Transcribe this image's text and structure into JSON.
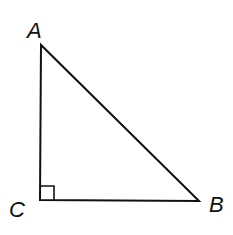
{
  "diagram": {
    "type": "right-triangle",
    "vertices": [
      {
        "name": "A",
        "x": 41,
        "y": 45,
        "label_x": 27,
        "label_y": 38
      },
      {
        "name": "C",
        "x": 40,
        "y": 200,
        "label_x": 9,
        "label_y": 217
      },
      {
        "name": "B",
        "x": 199,
        "y": 201,
        "label_x": 209,
        "label_y": 212
      }
    ],
    "right_angle_at": "C",
    "right_angle_marker_size": 14,
    "stroke_color": "#111111",
    "background": "#ffffff"
  },
  "labels": {
    "A": "A",
    "B": "B",
    "C": "C"
  }
}
